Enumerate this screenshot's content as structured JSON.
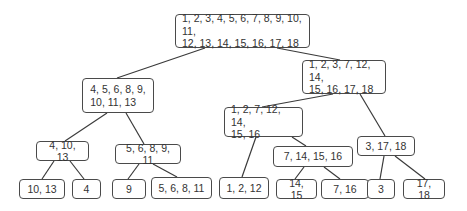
{
  "diagram": {
    "type": "tree",
    "nodes": {
      "root": "1, 2, 3, 4, 5, 6, 7, 8, 9, 10, 11,\n12, 13, 14, 15, 16, 17, 18",
      "l": "4, 5, 6, 8, 9,\n10, 11, 13",
      "r": "1, 2, 3, 7, 12, 14,\n15, 16, 17, 18",
      "ll": "4, 10, 13",
      "lr": "5, 6, 8, 9, 11",
      "rl": "1, 2, 7, 12, 14,\n15, 16",
      "rr": "3, 17, 18",
      "rlr": "7, 14, 15, 16",
      "lll": "10, 13",
      "llr": "4",
      "lrl": "9",
      "lrr": "5, 6, 8, 11",
      "rll": "1, 2, 12",
      "rlrl": "14, 15",
      "rlrr": "7, 16",
      "rrl": "3",
      "rrr": "17, 18"
    },
    "edges": [
      [
        "root",
        "l"
      ],
      [
        "root",
        "r"
      ],
      [
        "l",
        "ll"
      ],
      [
        "l",
        "lr"
      ],
      [
        "r",
        "rl"
      ],
      [
        "r",
        "rr"
      ],
      [
        "ll",
        "lll"
      ],
      [
        "ll",
        "llr"
      ],
      [
        "lr",
        "lrl"
      ],
      [
        "lr",
        "lrr"
      ],
      [
        "rl",
        "rll"
      ],
      [
        "rl",
        "rlr"
      ],
      [
        "rlr",
        "rlrl"
      ],
      [
        "rlr",
        "rlrr"
      ],
      [
        "rr",
        "rrl"
      ],
      [
        "rr",
        "rrr"
      ]
    ]
  }
}
